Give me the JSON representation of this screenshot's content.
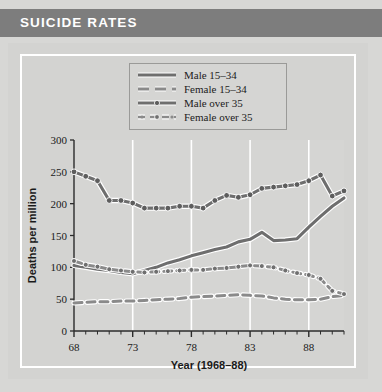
{
  "header": {
    "title": "SUICIDE RATES",
    "bar_color": "#7d7d7d",
    "text_color": "#ffffff"
  },
  "panel": {
    "background": "#d3d3d1",
    "border_color": "#ffffff"
  },
  "legend": {
    "position": "top-center",
    "entries": [
      {
        "label": "Male 15–34",
        "style": "solid",
        "marker": "none"
      },
      {
        "label": "Female 15–34",
        "style": "dashed",
        "marker": "none"
      },
      {
        "label": "Male over 35",
        "style": "solid-marker",
        "marker": "circle"
      },
      {
        "label": "Female over 35",
        "style": "dashed-marker",
        "marker": "circle"
      }
    ]
  },
  "chart_data": {
    "type": "line",
    "title": "SUICIDE RATES",
    "xlabel": "Year (1968–88)",
    "ylabel": "Deaths per million",
    "xlim": [
      68,
      91
    ],
    "ylim": [
      0,
      300
    ],
    "yticks": [
      0,
      50,
      100,
      150,
      200,
      250,
      300
    ],
    "xticks": [
      68,
      73,
      78,
      83,
      88
    ],
    "xtick_labels": [
      "68",
      "73",
      "78",
      "83",
      "88"
    ],
    "minor_xticks_every": 1,
    "grid": "vertical-white-at-major-xticks",
    "legend_position": "top-center",
    "x": [
      68,
      69,
      70,
      71,
      72,
      73,
      74,
      75,
      76,
      77,
      78,
      79,
      80,
      81,
      82,
      83,
      84,
      85,
      86,
      87,
      88,
      89,
      90,
      91
    ],
    "series": [
      {
        "name": "Male 15–34",
        "style": "solid",
        "marker": "none",
        "color": "#6e6e6e",
        "values": [
          103,
          100,
          97,
          95,
          92,
          90,
          95,
          100,
          107,
          112,
          118,
          123,
          128,
          132,
          140,
          144,
          155,
          142,
          143,
          145,
          163,
          180,
          196,
          209
        ]
      },
      {
        "name": "Female 15–34",
        "style": "dashed",
        "marker": "none",
        "color": "#8a8a8a",
        "values": [
          44,
          45,
          46,
          46,
          47,
          47,
          48,
          49,
          50,
          51,
          53,
          54,
          55,
          56,
          57,
          56,
          55,
          52,
          50,
          49,
          49,
          50,
          54,
          56
        ]
      },
      {
        "name": "Male over 35",
        "style": "solid-marker",
        "marker": "circle",
        "color": "#6e6e6e",
        "values": [
          250,
          243,
          236,
          205,
          205,
          201,
          193,
          193,
          193,
          196,
          196,
          193,
          205,
          213,
          210,
          214,
          224,
          226,
          228,
          230,
          236,
          245,
          212,
          220
        ]
      },
      {
        "name": "Female over 35",
        "style": "dashed-marker",
        "marker": "circle",
        "color": "#8a8a8a",
        "values": [
          110,
          104,
          101,
          97,
          95,
          93,
          92,
          93,
          94,
          95,
          96,
          96,
          98,
          99,
          101,
          103,
          102,
          100,
          95,
          91,
          88,
          82,
          63,
          58
        ]
      }
    ]
  }
}
